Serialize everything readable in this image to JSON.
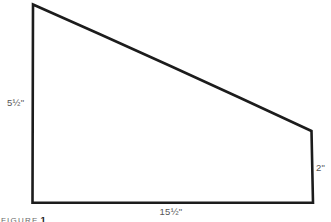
{
  "figure": {
    "dimensions": {
      "left_side": "5½\"",
      "right_side": "2\"",
      "bottom_side": "15½\""
    },
    "caption": {
      "label": "FIGURE",
      "number": "1"
    },
    "colors": {
      "line": "#1c1c1c",
      "dimension_text": "#565656",
      "background": "#ffffff"
    }
  }
}
